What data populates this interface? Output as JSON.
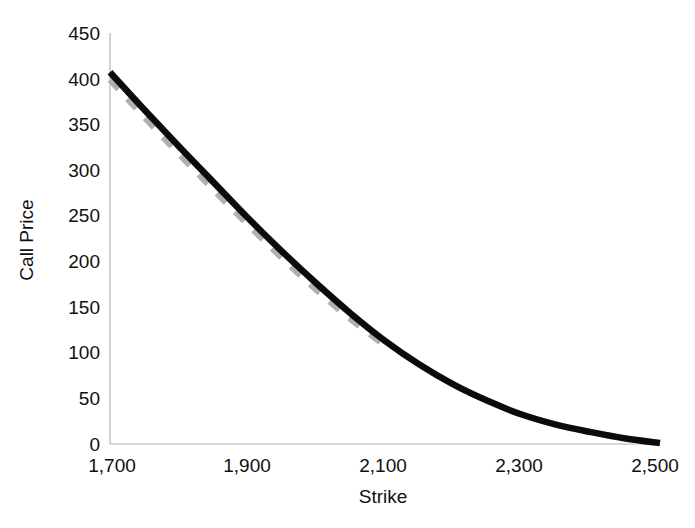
{
  "chart_data": {
    "type": "line",
    "title": "",
    "xlabel": "Strike",
    "ylabel": "Call Price",
    "xlim": [
      1700,
      2500
    ],
    "ylim": [
      0,
      450
    ],
    "grid": false,
    "legend": "none",
    "x_ticks": [
      "1,700",
      "1,900",
      "2,100",
      "2,300",
      "2,500"
    ],
    "x_tick_values": [
      1700,
      1900,
      2100,
      2300,
      2500
    ],
    "y_ticks": [
      "0",
      "50",
      "100",
      "150",
      "200",
      "250",
      "300",
      "350",
      "400",
      "450"
    ],
    "y_tick_values": [
      0,
      50,
      100,
      150,
      200,
      250,
      300,
      350,
      400,
      450
    ],
    "series": [
      {
        "name": "solid-black-curve",
        "style": "solid",
        "color": "#0b0b0b",
        "x": [
          1700,
          1750,
          1800,
          1850,
          1900,
          1950,
          2000,
          2050,
          2100,
          2150,
          2200,
          2250,
          2300,
          2350,
          2400,
          2450,
          2500
        ],
        "values": [
          407,
          366,
          326,
          287,
          248,
          211,
          176,
          143,
          113,
          87,
          65,
          47,
          32,
          21,
          13,
          6,
          1
        ]
      },
      {
        "name": "dashed-gray-curve",
        "style": "dashed",
        "color": "#b0b0b0",
        "x": [
          1700,
          1750,
          1800,
          1850,
          1900,
          1950,
          2000,
          2050,
          2100
        ],
        "values": [
          399,
          358,
          318,
          279,
          241,
          204,
          169,
          137,
          108
        ]
      }
    ]
  },
  "axes": {
    "y_axis_title": "Call Price",
    "x_axis_title": "Strike"
  }
}
